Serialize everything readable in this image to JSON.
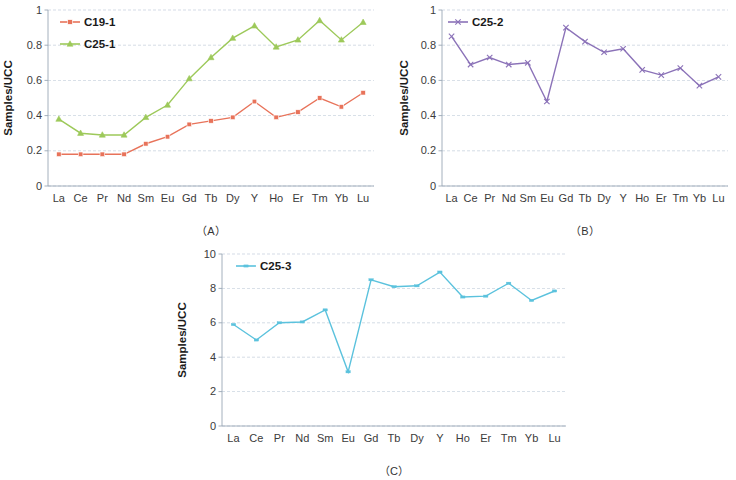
{
  "figure": {
    "background": "#ffffff",
    "categories": [
      "La",
      "Ce",
      "Pr",
      "Nd",
      "Sm",
      "Eu",
      "Gd",
      "Tb",
      "Dy",
      "Y",
      "Ho",
      "Er",
      "Tm",
      "Yb",
      "Lu"
    ],
    "ylabel": "Samples/UCC"
  },
  "panels": [
    {
      "id": "A",
      "caption": "（A）",
      "ylabel": "Samples/UCC",
      "yticks": [
        "0",
        "0.2",
        "0.4",
        "0.6",
        "0.8",
        "1"
      ],
      "legend": [
        {
          "label": "C19-1",
          "color": "#e8735a",
          "marker": "square"
        },
        {
          "label": "C25-1",
          "color": "#9dc95a",
          "marker": "triangle"
        }
      ]
    },
    {
      "id": "B",
      "caption": "（B）",
      "ylabel": "Samples/UCC",
      "yticks": [
        "0",
        "0.2",
        "0.4",
        "0.6",
        "0.8",
        "1"
      ],
      "legend": [
        {
          "label": "C25-2",
          "color": "#8b72b8",
          "marker": "cross"
        }
      ]
    },
    {
      "id": "C",
      "caption": "（C）",
      "ylabel": "Samples/UCC",
      "yticks": [
        "0",
        "2",
        "4",
        "6",
        "8",
        "10"
      ],
      "legend": [
        {
          "label": "C25-3",
          "color": "#5bc2dd",
          "marker": "dash"
        }
      ]
    }
  ],
  "chart_data": [
    {
      "type": "line",
      "panel": "A",
      "title": "（A）",
      "xlabel": "",
      "ylabel": "Samples/UCC",
      "categories": [
        "La",
        "Ce",
        "Pr",
        "Nd",
        "Sm",
        "Eu",
        "Gd",
        "Tb",
        "Dy",
        "Y",
        "Ho",
        "Er",
        "Tm",
        "Yb",
        "Lu"
      ],
      "ylim": [
        0,
        1
      ],
      "yticks": [
        0,
        0.2,
        0.4,
        0.6,
        0.8,
        1
      ],
      "grid": true,
      "legend_position": "top-left",
      "series": [
        {
          "name": "C19-1",
          "color": "#e8735a",
          "marker": "square",
          "values": [
            0.18,
            0.18,
            0.18,
            0.18,
            0.24,
            0.28,
            0.35,
            0.37,
            0.39,
            0.48,
            0.39,
            0.42,
            0.5,
            0.45,
            0.53
          ]
        },
        {
          "name": "C25-1",
          "color": "#9dc95a",
          "marker": "triangle",
          "values": [
            0.38,
            0.3,
            0.29,
            0.29,
            0.39,
            0.46,
            0.61,
            0.73,
            0.84,
            0.91,
            0.79,
            0.83,
            0.94,
            0.83,
            0.93
          ]
        }
      ]
    },
    {
      "type": "line",
      "panel": "B",
      "title": "（B）",
      "xlabel": "",
      "ylabel": "Samples/UCC",
      "categories": [
        "La",
        "Ce",
        "Pr",
        "Nd",
        "Sm",
        "Eu",
        "Gd",
        "Tb",
        "Dy",
        "Y",
        "Ho",
        "Er",
        "Tm",
        "Yb",
        "Lu"
      ],
      "ylim": [
        0,
        1
      ],
      "yticks": [
        0,
        0.2,
        0.4,
        0.6,
        0.8,
        1
      ],
      "grid": true,
      "legend_position": "top-left",
      "series": [
        {
          "name": "C25-2",
          "color": "#8b72b8",
          "marker": "cross",
          "values": [
            0.85,
            0.69,
            0.73,
            0.69,
            0.7,
            0.48,
            0.9,
            0.82,
            0.76,
            0.78,
            0.66,
            0.63,
            0.67,
            0.57,
            0.62
          ]
        }
      ]
    },
    {
      "type": "line",
      "panel": "C",
      "title": "（C）",
      "xlabel": "",
      "ylabel": "Samples/UCC",
      "categories": [
        "La",
        "Ce",
        "Pr",
        "Nd",
        "Sm",
        "Eu",
        "Gd",
        "Tb",
        "Dy",
        "Y",
        "Ho",
        "Er",
        "Tm",
        "Yb",
        "Lu"
      ],
      "ylim": [
        0,
        10
      ],
      "yticks": [
        0,
        2,
        4,
        6,
        8,
        10
      ],
      "grid": true,
      "legend_position": "top-left",
      "series": [
        {
          "name": "C25-3",
          "color": "#5bc2dd",
          "marker": "dash",
          "values": [
            5.9,
            5.0,
            6.0,
            6.05,
            6.75,
            3.15,
            8.5,
            8.1,
            8.15,
            8.95,
            7.5,
            7.55,
            8.3,
            7.3,
            7.85
          ]
        }
      ]
    }
  ]
}
